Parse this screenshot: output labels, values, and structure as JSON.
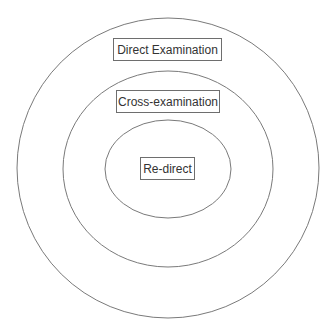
{
  "diagram": {
    "type": "nested-ellipses",
    "colors": {
      "stroke": "#7a7a7a",
      "text": "#333333",
      "background": "#ffffff"
    },
    "layers": [
      {
        "id": "outer",
        "label": "Direct Examination"
      },
      {
        "id": "middle",
        "label": "Cross-examination"
      },
      {
        "id": "inner",
        "label": "Re-direct"
      }
    ]
  }
}
